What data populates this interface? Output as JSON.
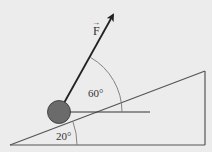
{
  "diagram": {
    "type": "physics-free-body-incline",
    "background": "#ececec",
    "line_color": "#555555",
    "ball_color": "#6b6b6b",
    "force": {
      "label": "F",
      "vector_mark": "→",
      "angle_from_horizontal_label": "60°"
    },
    "incline": {
      "angle_label": "20°"
    }
  }
}
